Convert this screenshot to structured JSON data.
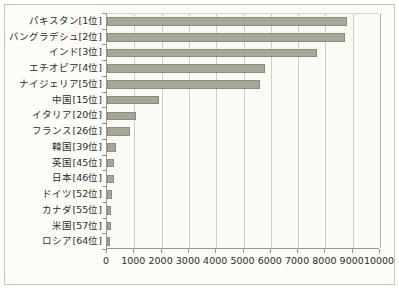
{
  "chart_data": {
    "type": "bar",
    "orientation": "horizontal",
    "title": "",
    "subtitle": "",
    "xlabel": "",
    "ylabel": "",
    "xlim": [
      0,
      10000
    ],
    "grid": true,
    "legend": false,
    "xticks": [
      "0",
      "1000",
      "2000",
      "3000",
      "4000",
      "5000",
      "6000",
      "7000",
      "8000",
      "9000",
      "10000"
    ],
    "xtick_values": [
      0,
      1000,
      2000,
      3000,
      4000,
      5000,
      6000,
      7000,
      8000,
      9000,
      10000
    ],
    "categories": [
      "パキスタン[1位]",
      "バングラデシュ[2位]",
      "インド[3位]",
      "エチオピア[4位]",
      "ナイジェリア[5位]",
      "中国[15位]",
      "イタリア[20位]",
      "フランス[26位]",
      "韓国[39位]",
      "英国[45位]",
      "日本[46位]",
      "ドイツ[52位]",
      "カナダ[55位]",
      "米国[57位]",
      "ロシア[64位]"
    ],
    "values": [
      8800,
      8700,
      7700,
      5800,
      5600,
      1900,
      1050,
      850,
      320,
      260,
      250,
      180,
      150,
      130,
      100
    ]
  },
  "style": {
    "bar_fill": "#a8a59b",
    "bar_border": "#8d8a80",
    "axis_color": "#9a978e",
    "grid_color": "#cfccc3",
    "frame_border": "#c9c6bd",
    "plot_background": "#fbfaf5",
    "frame_background": "#fdfcf7",
    "text_color": "#2b2b2b"
  }
}
